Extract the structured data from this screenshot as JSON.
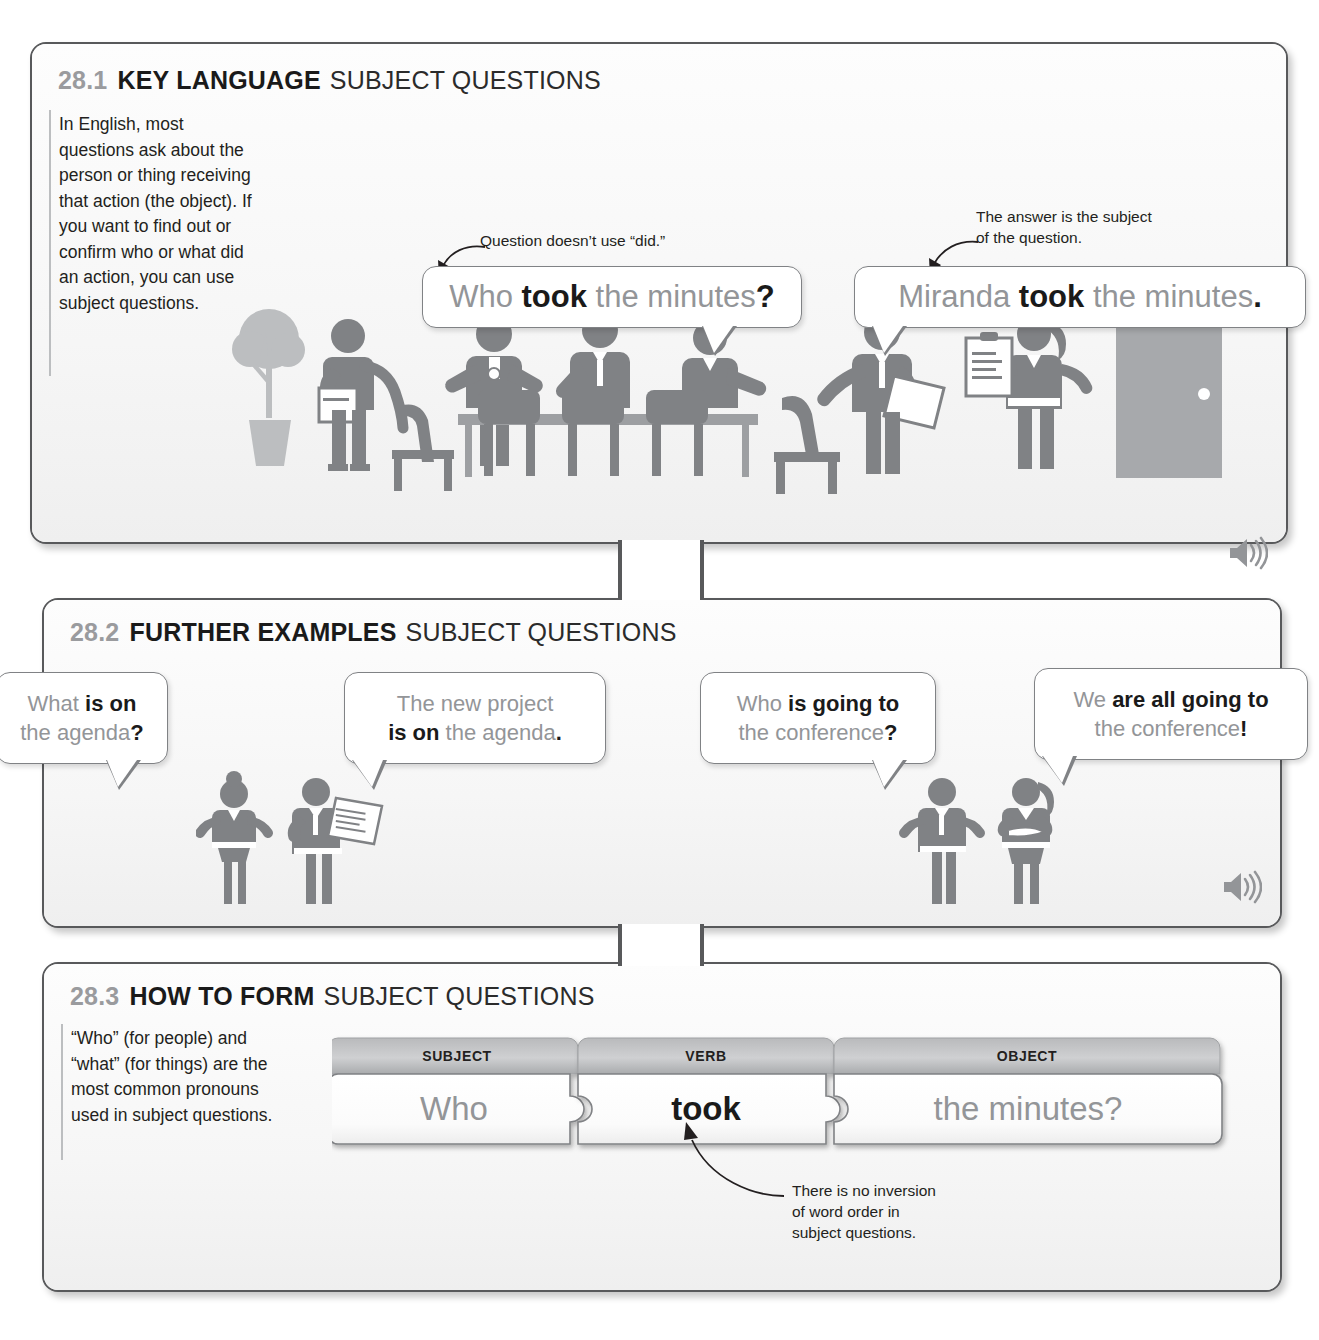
{
  "page": {
    "width": 1319,
    "height": 1340,
    "background": "#ffffff",
    "accent_gray": "#939598",
    "ink": "#231f20"
  },
  "sections": [
    {
      "id": "28.1",
      "number": "28.1",
      "title_strong": "KEY LANGUAGE",
      "title_light": "SUBJECT QUESTIONS",
      "body": "In English, most questions ask about the person or thing receiving that action (the object). If you want to find out or confirm who or what did an action, you can use subject questions.",
      "audio_icon": "speaker-icon",
      "callouts": [
        {
          "id": "callout-did",
          "line1": "Question doesn’t use “did.”",
          "line2": ""
        },
        {
          "id": "callout-subject",
          "line1": "The answer is the subject",
          "line2": "of the question."
        }
      ],
      "bubbles": [
        {
          "id": "bubble-who-took",
          "parts": [
            {
              "text": "Who ",
              "bold": false
            },
            {
              "text": "took",
              "bold": true
            },
            {
              "text": " the minutes",
              "bold": false
            },
            {
              "text": "?",
              "bold": true
            }
          ]
        },
        {
          "id": "bubble-miranda-took",
          "parts": [
            {
              "text": "Miranda ",
              "bold": false
            },
            {
              "text": "took",
              "bold": true
            },
            {
              "text": " the minutes",
              "bold": false
            },
            {
              "text": ".",
              "bold": true
            }
          ]
        }
      ],
      "illustration": "office-meeting-scene"
    },
    {
      "id": "28.2",
      "number": "28.2",
      "title_strong": "FURTHER EXAMPLES",
      "title_light": "SUBJECT QUESTIONS",
      "audio_icon": "speaker-icon",
      "bubbles": [
        {
          "id": "bubble-what-agenda",
          "lines": [
            [
              {
                "text": "What ",
                "bold": false
              },
              {
                "text": "is on",
                "bold": true
              }
            ],
            [
              {
                "text": "the agenda",
                "bold": false
              },
              {
                "text": "?",
                "bold": true
              }
            ]
          ]
        },
        {
          "id": "bubble-new-project",
          "lines": [
            [
              {
                "text": "The new project",
                "bold": false
              }
            ],
            [
              {
                "text": "is on",
                "bold": true
              },
              {
                "text": " the agenda",
                "bold": false
              },
              {
                "text": ".",
                "bold": true
              }
            ]
          ]
        },
        {
          "id": "bubble-who-conference",
          "lines": [
            [
              {
                "text": "Who ",
                "bold": false
              },
              {
                "text": "is going to",
                "bold": true
              }
            ],
            [
              {
                "text": "the conference",
                "bold": false
              },
              {
                "text": "?",
                "bold": true
              }
            ]
          ]
        },
        {
          "id": "bubble-we-conference",
          "lines": [
            [
              {
                "text": "We ",
                "bold": false
              },
              {
                "text": "are all going  to",
                "bold": true
              }
            ],
            [
              {
                "text": "the conference",
                "bold": false
              },
              {
                "text": "!",
                "bold": true
              }
            ]
          ]
        }
      ],
      "illustration_left": "woman-shrugging-and-man-with-document",
      "illustration_right": "man-shrugging-and-woman-with-folder"
    },
    {
      "id": "28.3",
      "number": "28.3",
      "title_strong": "HOW TO FORM",
      "title_light": "SUBJECT QUESTIONS",
      "body": "“Who” (for people) and “what” (for things) are the most common pronouns used in subject questions.",
      "puzzle": [
        {
          "label": "SUBJECT",
          "word": "Who",
          "emphasis": "gray"
        },
        {
          "label": "VERB",
          "word": "took",
          "emphasis": "black"
        },
        {
          "label": "OBJECT",
          "word": "the minutes?",
          "emphasis": "gray"
        }
      ],
      "callouts": [
        {
          "id": "callout-no-inversion",
          "line1": "There is no inversion",
          "line2": "of word order in",
          "line3": "subject questions."
        }
      ]
    }
  ]
}
